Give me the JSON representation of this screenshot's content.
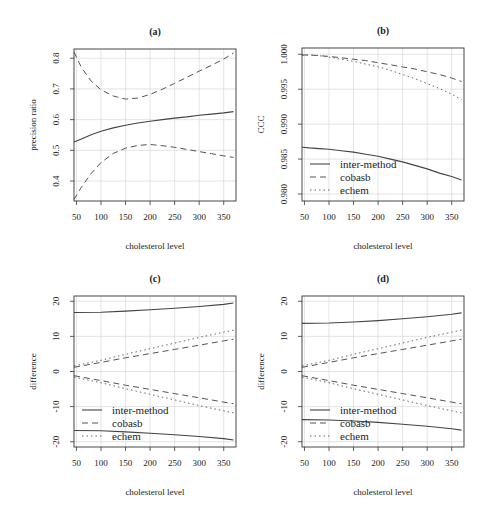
{
  "chart_data": [
    {
      "id": "a",
      "type": "line",
      "title": "(a)",
      "xlabel": "cholesterol level",
      "ylabel": "precision ratio",
      "xlim": [
        45,
        375
      ],
      "ylim": [
        0.335,
        0.83
      ],
      "xticks": [
        50,
        100,
        150,
        200,
        250,
        300,
        350
      ],
      "yticks": [
        0.4,
        0.5,
        0.6,
        0.7,
        0.8
      ],
      "ytick_labels": [
        "0.4",
        "0.5",
        "0.6",
        "0.7",
        "0.8"
      ],
      "grid": true,
      "legend": null,
      "x": [
        45,
        60,
        80,
        100,
        125,
        150,
        175,
        200,
        225,
        250,
        275,
        300,
        325,
        350,
        370
      ],
      "series": [
        {
          "name": "estimate",
          "style": "solid",
          "values": [
            0.527,
            0.537,
            0.551,
            0.562,
            0.573,
            0.582,
            0.589,
            0.595,
            0.6,
            0.605,
            0.609,
            0.614,
            0.618,
            0.622,
            0.626
          ]
        },
        {
          "name": "upper bound",
          "style": "dashed",
          "values": [
            0.82,
            0.77,
            0.725,
            0.697,
            0.677,
            0.667,
            0.67,
            0.682,
            0.699,
            0.718,
            0.738,
            0.758,
            0.777,
            0.797,
            0.817
          ]
        },
        {
          "name": "lower bound",
          "style": "dashed",
          "values": [
            0.34,
            0.38,
            0.425,
            0.46,
            0.49,
            0.507,
            0.516,
            0.519,
            0.515,
            0.51,
            0.503,
            0.496,
            0.489,
            0.482,
            0.477
          ]
        }
      ]
    },
    {
      "id": "b",
      "type": "line",
      "title": "(b)",
      "xlabel": "cholesterol level",
      "ylabel": "CCC",
      "xlim": [
        45,
        375
      ],
      "ylim": [
        0.979,
        1.0009
      ],
      "xticks": [
        50,
        100,
        150,
        200,
        250,
        300,
        350
      ],
      "yticks": [
        0.98,
        0.985,
        0.99,
        0.995,
        1.0
      ],
      "ytick_labels": [
        "0.980",
        "0.985",
        "0.990",
        "0.995",
        "1.000"
      ],
      "grid": true,
      "legend": {
        "position": "bottomleft",
        "entries": [
          "inter-method",
          "cobasb",
          "echem"
        ]
      },
      "x": [
        45,
        60,
        80,
        100,
        125,
        150,
        175,
        200,
        225,
        250,
        275,
        300,
        325,
        350,
        370
      ],
      "series": [
        {
          "name": "inter-method",
          "style": "solid",
          "values": [
            0.9867,
            0.9866,
            0.9865,
            0.9864,
            0.9862,
            0.986,
            0.9857,
            0.9854,
            0.985,
            0.9846,
            0.9841,
            0.9836,
            0.983,
            0.9825,
            0.982
          ]
        },
        {
          "name": "cobasb",
          "style": "dashed",
          "values": [
            0.9999,
            0.9999,
            0.9998,
            0.9997,
            0.9995,
            0.9993,
            0.9991,
            0.9988,
            0.9985,
            0.9982,
            0.9979,
            0.9975,
            0.9971,
            0.9966,
            0.9961
          ]
        },
        {
          "name": "echem",
          "style": "dotted",
          "values": [
            0.9999,
            0.9999,
            0.9998,
            0.9996,
            0.9993,
            0.999,
            0.9986,
            0.9982,
            0.9977,
            0.9971,
            0.9965,
            0.9958,
            0.9951,
            0.9943,
            0.9935
          ]
        }
      ]
    },
    {
      "id": "c",
      "type": "line",
      "title": "(c)",
      "xlabel": "cholesterol level",
      "ylabel": "difference",
      "xlim": [
        45,
        375
      ],
      "ylim": [
        -21.5,
        21.5
      ],
      "xticks": [
        50,
        100,
        150,
        200,
        250,
        300,
        350
      ],
      "yticks": [
        -20,
        -10,
        0,
        10,
        20
      ],
      "ytick_labels": [
        "-20",
        "-10",
        "0",
        "10",
        "20"
      ],
      "grid": true,
      "legend": {
        "position": "bottomleft",
        "entries": [
          "inter-method",
          "cobasb",
          "echem"
        ]
      },
      "x": [
        45,
        100,
        150,
        200,
        250,
        300,
        350,
        370
      ],
      "series": [
        {
          "name": "inter-method upper",
          "legend": "inter-method",
          "style": "solid",
          "values": [
            16.8,
            16.9,
            17.2,
            17.6,
            18.0,
            18.5,
            19.1,
            19.5
          ]
        },
        {
          "name": "inter-method lower",
          "legend": "inter-method",
          "style": "solid",
          "values": [
            -16.8,
            -16.9,
            -17.2,
            -17.6,
            -18.0,
            -18.5,
            -19.1,
            -19.5
          ]
        },
        {
          "name": "cobasb upper",
          "legend": "cobasb",
          "style": "dashed",
          "values": [
            1.2,
            2.6,
            3.9,
            5.1,
            6.3,
            7.5,
            8.7,
            9.2
          ]
        },
        {
          "name": "cobasb lower",
          "legend": "cobasb",
          "style": "dashed",
          "values": [
            -1.2,
            -2.6,
            -3.9,
            -5.1,
            -6.3,
            -7.5,
            -8.7,
            -9.2
          ]
        },
        {
          "name": "echem upper",
          "legend": "echem",
          "style": "dotted",
          "values": [
            1.6,
            3.2,
            4.9,
            6.5,
            8.1,
            9.7,
            11.2,
            11.8
          ]
        },
        {
          "name": "echem lower",
          "legend": "echem",
          "style": "dotted",
          "values": [
            -1.6,
            -3.2,
            -4.9,
            -6.5,
            -8.1,
            -9.7,
            -11.2,
            -11.8
          ]
        }
      ]
    },
    {
      "id": "d",
      "type": "line",
      "title": "(d)",
      "xlabel": "cholesterol level",
      "ylabel": "difference",
      "xlim": [
        45,
        375
      ],
      "ylim": [
        -21.5,
        21.5
      ],
      "xticks": [
        50,
        100,
        150,
        200,
        250,
        300,
        350
      ],
      "yticks": [
        -20,
        -10,
        0,
        10,
        20
      ],
      "ytick_labels": [
        "-20",
        "-10",
        "0",
        "10",
        "20"
      ],
      "grid": true,
      "legend": {
        "position": "bottomleft",
        "entries": [
          "inter-method",
          "cobasb",
          "echem"
        ]
      },
      "x": [
        45,
        100,
        150,
        200,
        250,
        300,
        350,
        370
      ],
      "series": [
        {
          "name": "inter-method upper",
          "legend": "inter-method",
          "style": "solid",
          "values": [
            13.7,
            13.8,
            14.1,
            14.5,
            15.0,
            15.6,
            16.3,
            16.7
          ]
        },
        {
          "name": "inter-method lower",
          "legend": "inter-method",
          "style": "solid",
          "values": [
            -13.7,
            -13.8,
            -14.1,
            -14.5,
            -15.0,
            -15.6,
            -16.3,
            -16.7
          ]
        },
        {
          "name": "cobasb upper",
          "legend": "cobasb",
          "style": "dashed",
          "values": [
            1.2,
            2.6,
            3.9,
            5.1,
            6.3,
            7.5,
            8.7,
            9.2
          ]
        },
        {
          "name": "cobasb lower",
          "legend": "cobasb",
          "style": "dashed",
          "values": [
            -1.2,
            -2.6,
            -3.9,
            -5.1,
            -6.3,
            -7.5,
            -8.7,
            -9.2
          ]
        },
        {
          "name": "echem upper",
          "legend": "echem",
          "style": "dotted",
          "values": [
            1.6,
            3.2,
            4.9,
            6.5,
            8.1,
            9.7,
            11.2,
            11.8
          ]
        },
        {
          "name": "echem lower",
          "legend": "echem",
          "style": "dotted",
          "values": [
            -1.6,
            -3.2,
            -4.9,
            -6.5,
            -8.1,
            -9.7,
            -11.2,
            -11.8
          ]
        }
      ]
    }
  ],
  "layout": {
    "panels": [
      {
        "id": "a",
        "left": 74,
        "right": 236,
        "top": 49,
        "bottom": 201
      },
      {
        "id": "b",
        "left": 302,
        "right": 464,
        "top": 48,
        "bottom": 201
      },
      {
        "id": "c",
        "left": 74,
        "right": 236,
        "top": 296,
        "bottom": 447
      },
      {
        "id": "d",
        "left": 302,
        "right": 464,
        "top": 296,
        "bottom": 447
      }
    ]
  }
}
